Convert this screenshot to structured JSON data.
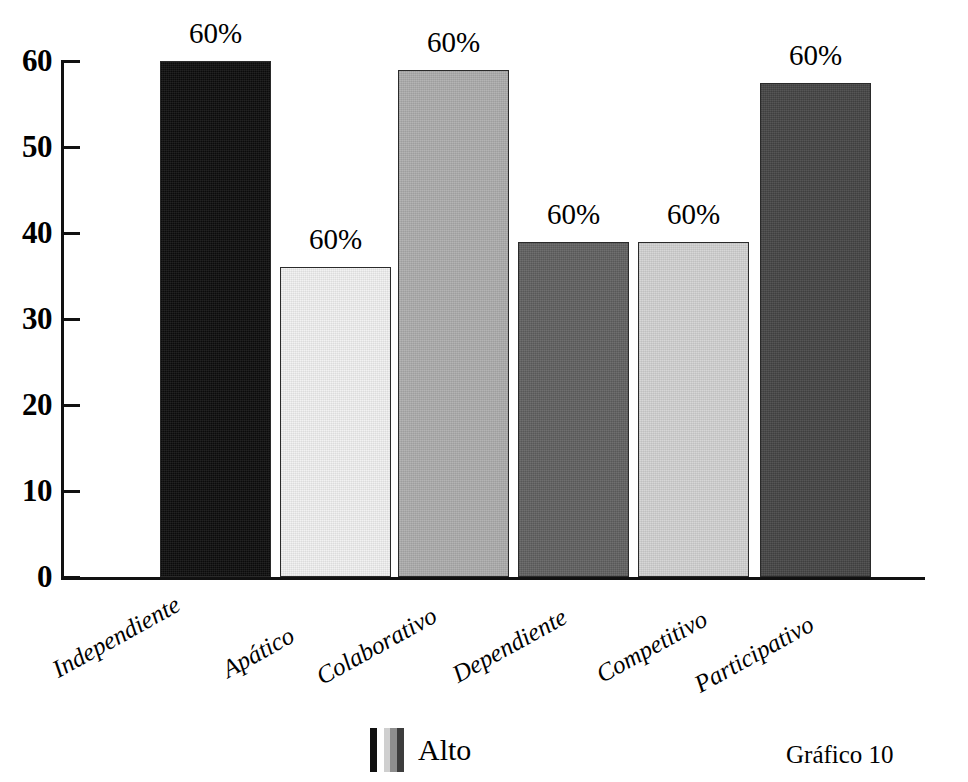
{
  "chart_data": {
    "type": "bar",
    "title": "",
    "subtitle": "",
    "xlabel": "",
    "ylabel": "",
    "ylim": [
      0,
      60
    ],
    "grid": false,
    "legend_position": "bottom-center",
    "y_ticks": [
      "0",
      "10",
      "20",
      "30",
      "40",
      "50",
      "60"
    ],
    "y_tick_values": [
      0,
      10,
      20,
      30,
      40,
      50,
      60
    ],
    "categories": [
      "Independiente",
      "Apático",
      "Colaborativo",
      "Dependiente",
      "Competitivo",
      "Participativo"
    ],
    "series": [
      {
        "name": "Alto",
        "values": [
          60,
          36,
          59,
          39,
          39,
          57.5
        ],
        "data_labels": [
          "60%",
          "60%",
          "60%",
          "60%",
          "60%",
          "60%"
        ],
        "colors": [
          "#0d0d0d",
          "#f2f2f2",
          "#adadad",
          "#616161",
          "#d3d3d3",
          "#454545"
        ]
      }
    ],
    "legend": [
      {
        "label": "Alto",
        "swatch_stripes": [
          "#111111",
          "#ffffff",
          "#cfcfcf",
          "#8e8e8e",
          "#3d3d3d"
        ]
      }
    ],
    "caption": "Gráfico 10"
  }
}
